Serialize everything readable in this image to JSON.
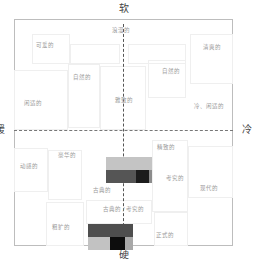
{
  "axes": {
    "top": "软",
    "bottom": "硬",
    "left": "暖",
    "right": "冷"
  },
  "words": [
    {
      "label": "浪漫的",
      "x": 112,
      "y": 28
    },
    {
      "label": "可爱的",
      "x": 36,
      "y": 43
    },
    {
      "label": "清爽的",
      "x": 203,
      "y": 45
    },
    {
      "label": "自然的",
      "x": 73,
      "y": 75
    },
    {
      "label": "自然的",
      "x": 162,
      "y": 69
    },
    {
      "label": "闲适的",
      "x": 24,
      "y": 101
    },
    {
      "label": "雅致的",
      "x": 115,
      "y": 98
    },
    {
      "label": "冷、闲适的",
      "x": 194,
      "y": 104
    },
    {
      "label": "精致的",
      "x": 157,
      "y": 145
    },
    {
      "label": "豪华的",
      "x": 58,
      "y": 153
    },
    {
      "label": "动感的",
      "x": 20,
      "y": 164
    },
    {
      "label": "考究的",
      "x": 166,
      "y": 176
    },
    {
      "label": "古典的",
      "x": 93,
      "y": 188
    },
    {
      "label": "现代的",
      "x": 200,
      "y": 186
    },
    {
      "label": "古典的 / 考究的",
      "x": 103,
      "y": 207
    },
    {
      "label": "粗犷的",
      "x": 52,
      "y": 225
    },
    {
      "label": "正式的",
      "x": 156,
      "y": 233
    }
  ],
  "palettes": [
    {
      "name": "classic-palette",
      "x": 106,
      "y": 157,
      "rows": [
        [
          {
            "color": "#c4c4c4",
            "w": 46
          }
        ],
        [
          {
            "color": "#555555",
            "w": 30
          },
          {
            "color": "#1c1c1c",
            "w": 13
          },
          {
            "color": "#8c8c8c",
            "w": 3
          }
        ]
      ]
    },
    {
      "name": "rugged-palette",
      "x": 88,
      "y": 224,
      "rows": [
        [
          {
            "color": "#4e4e4e",
            "w": 45
          }
        ],
        [
          {
            "color": "#c2c2c2",
            "w": 22
          },
          {
            "color": "#0d0d0d",
            "w": 15
          },
          {
            "color": "#a8a8a8",
            "w": 8
          }
        ]
      ]
    }
  ]
}
